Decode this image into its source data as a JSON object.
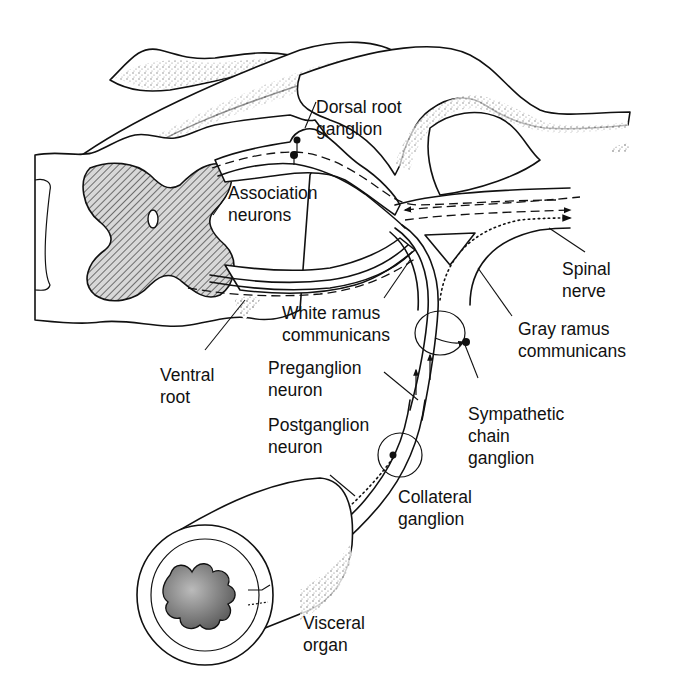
{
  "diagram": {
    "labels": {
      "dorsal_root_ganglion": [
        "Dorsal root",
        "ganglion"
      ],
      "association_neurons": [
        "Association",
        "neurons"
      ],
      "spinal_nerve": [
        "Spinal",
        "nerve"
      ],
      "white_ramus_communicans": [
        "White ramus",
        "communicans"
      ],
      "gray_ramus_communicans": [
        "Gray ramus",
        "communicans"
      ],
      "ventral_root": [
        "Ventral",
        "root"
      ],
      "preganglion_neuron": [
        "Preganglion",
        "neuron"
      ],
      "sympathetic_chain_ganglion": [
        "Sympathetic",
        "chain",
        "ganglion"
      ],
      "postganglion_neuron": [
        "Postganglion",
        "neuron"
      ],
      "collateral_ganglion": [
        "Collateral",
        "ganglion"
      ],
      "visceral_organ": [
        "Visceral",
        "organ"
      ]
    },
    "colors": {
      "line": "#111111",
      "background": "#ffffff",
      "gray_matter_hatch": "#111111",
      "stipple": "#555555"
    }
  }
}
